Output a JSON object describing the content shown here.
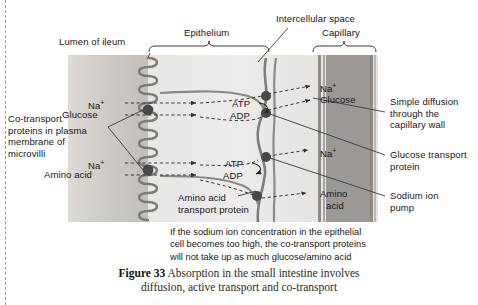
{
  "figure": {
    "number_label": "Figure 33",
    "caption_line1": "Absorption in the small intestine involves",
    "caption_line2": "diffusion, active transport and co-transport"
  },
  "region_labels": {
    "lumen": "Lumen of ileum",
    "epithelium": "Epithelium",
    "intercellular_space": "Intercellular space",
    "capillary": "Capillary"
  },
  "left_annotations": {
    "co_transport": {
      "line1": "Co-transport",
      "line2": "proteins in plasma",
      "line3": "membrane of",
      "line4": "microvilli"
    }
  },
  "right_annotations": {
    "simple_diffusion": {
      "line1": "Simple diffusion",
      "line2": "through the",
      "line3": "capillary wall"
    },
    "glucose_transport": {
      "line1": "Glucose transport",
      "line2": "protein"
    },
    "sodium_pump": {
      "line1": "Sodium ion",
      "line2": "pump"
    }
  },
  "inner_labels": {
    "amino_acid_transport": {
      "line1": "Amino acid",
      "line2": "transport protein"
    }
  },
  "molecules": {
    "lumen_top_na": "Na",
    "lumen_top_na_charge": "+",
    "lumen_glucose": "Glucose",
    "lumen_bottom_na": "Na",
    "lumen_bottom_na_charge": "+",
    "lumen_amino_acid": "Amino acid",
    "cap_na_top": "Na",
    "cap_na_top_charge": "+",
    "cap_glucose": "Glucose",
    "cap_na_mid": "Na",
    "cap_na_mid_charge": "+",
    "cap_amino_line1": "Amino",
    "cap_amino_line2": "acid"
  },
  "energy_labels": {
    "atp_upper": "ATP",
    "adp_upper": "ADP",
    "atp_lower": "ATP",
    "adp_lower": "ADP"
  },
  "note": {
    "line1": "If the sodium ion concentration in the epithelial",
    "line2": "cell becomes too high, the co-transport proteins",
    "line3": "will not take up as much glucose/amino acid"
  },
  "colors": {
    "text": "#171717",
    "lumen_fill": "#cfcbc7",
    "epithelium_fill": "#eeecea",
    "capillary_fill": "#9b9895",
    "membrane_stroke": "#7f7c79",
    "protein_node": "#4a4846",
    "arrow_stroke": "#3a3a3a"
  }
}
